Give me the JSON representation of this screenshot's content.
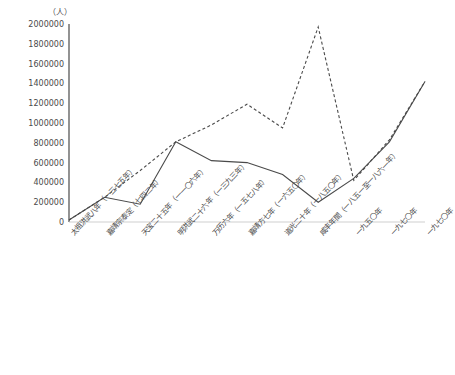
{
  "chart_data": {
    "type": "line",
    "title": "",
    "subtitle": "",
    "xlabel": "",
    "ylabel": "（人）",
    "unit_label": "（人）",
    "ylim": [
      0,
      2000000
    ],
    "ytick_step": 200000,
    "yticks": [
      "2000000",
      "1800000",
      "1600000",
      "1400000",
      "1200000",
      "1000000",
      "800000",
      "600000",
      "400000",
      "200000",
      "0"
    ],
    "grid": false,
    "legend": "none",
    "categories": [
      "太祖洪武八年（一三七五年）",
      "嘉靖宗泰定（七四二年）",
      "天宝二十五年（一一〇六年）",
      "明洪武二十六年（一三九三年）",
      "万历六年（一五七八年）",
      "嘉靖方七年（一六五〇年）",
      "道光二十年（一八五〇年）",
      "咸丰年間（一八五一至一八六一年）",
      "一九五〇年",
      "一九七〇年",
      "一九七〇年"
    ],
    "categories_note": "Rotated Japanese/Chinese era-year axis labels",
    "series": [
      {
        "name": "solid-line",
        "style": "solid",
        "color": "#4a4a4a",
        "values": [
          20000,
          250000,
          180000,
          810000,
          620000,
          600000,
          480000,
          200000,
          440000,
          810000,
          1420000
        ]
      },
      {
        "name": "dashed-line",
        "style": "dashed",
        "color": "#4a4a4a",
        "values": [
          20000,
          250000,
          520000,
          810000,
          980000,
          1190000,
          950000,
          1970000,
          420000,
          830000,
          1420000
        ]
      }
    ]
  },
  "axes": {
    "y_axis_name": "y-axis",
    "x_axis_name": "x-axis"
  }
}
